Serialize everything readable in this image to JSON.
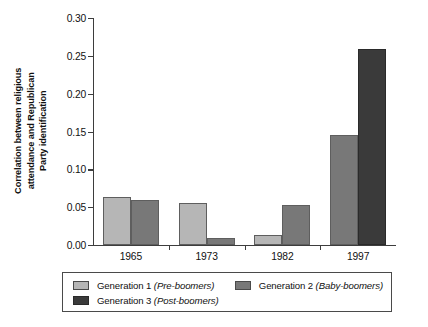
{
  "chart_data": {
    "type": "bar",
    "title": "",
    "xlabel": "",
    "ylabel": "Correlation between religious attendance and Republican Party identification",
    "ylabel_lines": [
      "Correlation between religious",
      "attendance and Republican",
      "Party identification"
    ],
    "categories": [
      "1965",
      "1973",
      "1982",
      "1997"
    ],
    "ylim": [
      0.0,
      0.3
    ],
    "ytick_labels": [
      "0.00",
      "0.05",
      "0.10",
      "0.15",
      "0.20",
      "0.25",
      "0.30"
    ],
    "ytick_values": [
      0.0,
      0.05,
      0.1,
      0.15,
      0.2,
      0.25,
      0.3
    ],
    "grid": false,
    "legend_position": "below-plot",
    "series": [
      {
        "name": "Generation 1 (Pre-boomers)",
        "name_plain": "Generation 1",
        "name_italic": "(Pre-boomers)",
        "color": "#b6b6b6",
        "values": [
          0.063,
          0.056,
          0.013,
          null
        ]
      },
      {
        "name": "Generation 2 (Baby-boomers)",
        "name_plain": "Generation 2",
        "name_italic": "(Baby-boomers)",
        "color": "#787878",
        "values": [
          0.059,
          0.009,
          0.053,
          0.145
        ]
      },
      {
        "name": "Generation 3 (Post-boomers)",
        "name_plain": "Generation 3",
        "name_italic": "(Post-boomers)",
        "color": "#3a3a3a",
        "values": [
          null,
          null,
          null,
          0.259
        ]
      }
    ]
  },
  "legend": {
    "entries": [
      {
        "label_plain": "Generation 1 ",
        "label_italic": "(Pre-boomers)",
        "color": "#b6b6b6"
      },
      {
        "label_plain": "Generation 2 ",
        "label_italic": "(Baby-boomers)",
        "color": "#787878"
      },
      {
        "label_plain": "Generation 3 ",
        "label_italic": "(Post-boomers)",
        "color": "#3a3a3a"
      }
    ]
  }
}
